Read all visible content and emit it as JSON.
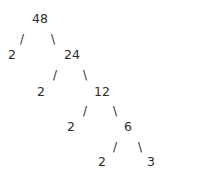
{
  "diagram": {
    "type": "factor-tree",
    "root": "48",
    "nodes": [
      {
        "id": "n48",
        "label": "48",
        "x": 32,
        "y": 12
      },
      {
        "id": "n2a",
        "label": "2",
        "x": 8,
        "y": 48
      },
      {
        "id": "n24",
        "label": "24",
        "x": 64,
        "y": 48
      },
      {
        "id": "n2b",
        "label": "2",
        "x": 37,
        "y": 85
      },
      {
        "id": "n12",
        "label": "12",
        "x": 94,
        "y": 85
      },
      {
        "id": "n2c",
        "label": "2",
        "x": 67,
        "y": 120
      },
      {
        "id": "n6",
        "label": "6",
        "x": 124,
        "y": 120
      },
      {
        "id": "n2d",
        "label": "2",
        "x": 98,
        "y": 155
      },
      {
        "id": "n3",
        "label": "3",
        "x": 147,
        "y": 155
      }
    ],
    "edges": [
      {
        "from": "n48",
        "to": "n2a",
        "glyph": "/",
        "x": 20,
        "y": 33
      },
      {
        "from": "n48",
        "to": "n24",
        "glyph": "\\",
        "x": 51,
        "y": 33
      },
      {
        "from": "n24",
        "to": "n2b",
        "glyph": "/",
        "x": 53,
        "y": 69
      },
      {
        "from": "n24",
        "to": "n12",
        "glyph": "\\",
        "x": 83,
        "y": 69
      },
      {
        "from": "n12",
        "to": "n2c",
        "glyph": "/",
        "x": 83,
        "y": 105
      },
      {
        "from": "n12",
        "to": "n6",
        "glyph": "\\",
        "x": 113,
        "y": 105
      },
      {
        "from": "n6",
        "to": "n2d",
        "glyph": "/",
        "x": 113,
        "y": 141
      },
      {
        "from": "n6",
        "to": "n3",
        "glyph": "\\",
        "x": 138,
        "y": 141
      }
    ]
  }
}
